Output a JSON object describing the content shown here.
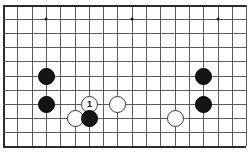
{
  "figure": {
    "kind": "go-board-diagram",
    "caption": "",
    "width": 249,
    "height": 159,
    "background_color": "#ffffff"
  },
  "board": {
    "line_color": "#5a5a5a",
    "edge_color": "#2b2b2b",
    "columns": 18,
    "rows": 11,
    "left": 3,
    "top": 5,
    "col_spacing": 14.3,
    "row_spacing": 14.1,
    "heavy_edges": [
      "left",
      "bottom",
      "top"
    ],
    "star_point_color": "#1a1a1a",
    "star_points": [
      {
        "col": 3,
        "row": 1
      },
      {
        "col": 9,
        "row": 1
      },
      {
        "col": 15,
        "row": 1
      }
    ]
  },
  "stones": {
    "black_color": "#141414",
    "white_color": "#fdfdfd",
    "diameter": 17,
    "items": [
      {
        "name": "stone-black-c3r5",
        "color": "black",
        "col": 3,
        "row": 5,
        "label": ""
      },
      {
        "name": "stone-black-c3r7",
        "color": "black",
        "col": 3,
        "row": 7,
        "label": ""
      },
      {
        "name": "stone-white-c5r8",
        "color": "white",
        "col": 5,
        "row": 8,
        "label": ""
      },
      {
        "name": "stone-white-move-1",
        "color": "white",
        "col": 6,
        "row": 7,
        "label": "1"
      },
      {
        "name": "stone-black-c6r8",
        "color": "black",
        "col": 6,
        "row": 8,
        "label": ""
      },
      {
        "name": "stone-white-c8r7",
        "color": "white",
        "col": 8,
        "row": 7,
        "label": ""
      },
      {
        "name": "stone-white-c12r8",
        "color": "white",
        "col": 12,
        "row": 8,
        "label": ""
      },
      {
        "name": "stone-black-c14r5",
        "color": "black",
        "col": 14,
        "row": 5,
        "label": ""
      },
      {
        "name": "stone-black-c14r7",
        "color": "black",
        "col": 14,
        "row": 7,
        "label": ""
      }
    ]
  }
}
